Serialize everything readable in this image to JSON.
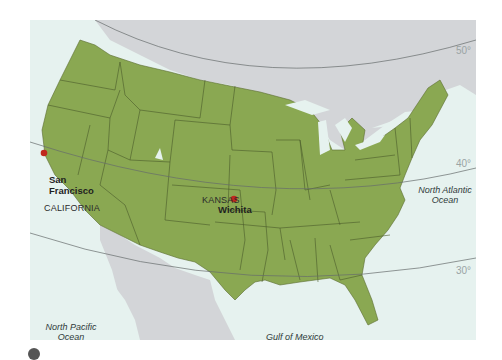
{
  "map": {
    "title": "United States latitude map",
    "colors": {
      "land_us": "#8aa852",
      "land_other": "#d3d5d8",
      "water": "#e6f2ef",
      "borders": "#4a5a2a",
      "parallels": "#666c6c",
      "city_marker": "#c0281e"
    },
    "parallels": [
      {
        "label": "50°"
      },
      {
        "label": "40°"
      },
      {
        "label": "30°"
      }
    ],
    "oceans": [
      {
        "line1": "North Pacific",
        "line2": "Ocean"
      },
      {
        "line1": "North Atlantic",
        "line2": "Ocean"
      },
      {
        "line1": "Gulf of Mexico",
        "line2": ""
      }
    ],
    "states": [
      {
        "name": "CALIFORNIA"
      },
      {
        "name": "KANSAS"
      }
    ],
    "cities": [
      {
        "line1": "San",
        "line2": "Francisco"
      },
      {
        "line1": "Wichita",
        "line2": ""
      }
    ]
  }
}
